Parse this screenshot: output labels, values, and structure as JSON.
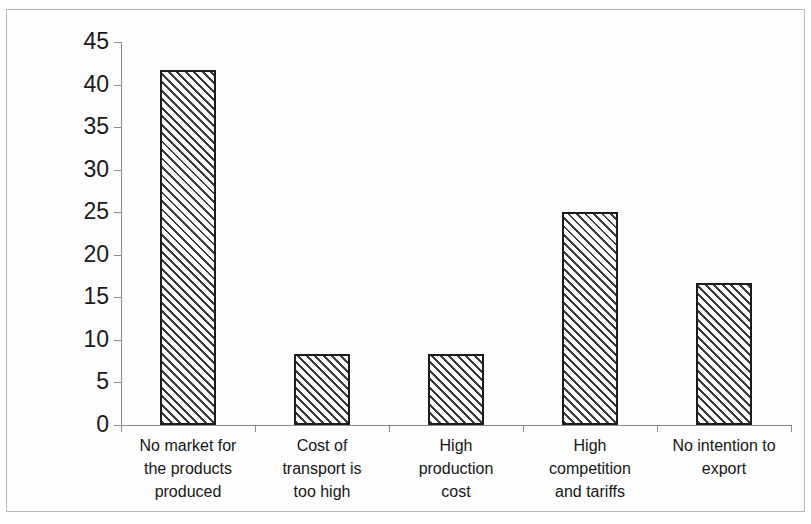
{
  "chart_data": {
    "type": "bar",
    "title": "",
    "subtitle": "",
    "xlabel": "",
    "ylabel": "",
    "ylim": [
      0,
      45
    ],
    "ytick_step": 5,
    "yticks": [
      0,
      5,
      10,
      15,
      20,
      25,
      30,
      35,
      40,
      45
    ],
    "ytick_labels": [
      "0",
      "5",
      "10",
      "15",
      "20",
      "25",
      "30",
      "35",
      "40",
      "45"
    ],
    "grid": false,
    "legend": false,
    "legend_position": "none",
    "categories": [
      "No market for the products produced",
      "Cost of transport is too high",
      "High production cost",
      "High competition and tariffs",
      "No intention to export"
    ],
    "category_lines": [
      [
        "No market for",
        "the products",
        "produced"
      ],
      [
        "Cost of",
        "transport is",
        "too high"
      ],
      [
        "High",
        "production",
        "cost"
      ],
      [
        "High",
        "competition",
        "and tariffs"
      ],
      [
        "No intention to",
        "export"
      ]
    ],
    "values": [
      41.7,
      8.3,
      8.3,
      25.0,
      16.7
    ],
    "series": [
      {
        "name": "",
        "values": [
          41.7,
          8.3,
          8.3,
          25.0,
          16.7
        ]
      }
    ],
    "bar_fill": "diagonal-hatch",
    "bar_edge_color": "#1c1c1c",
    "axis_color": "#8a8a8a",
    "frame_color": "#b9b9b9",
    "background_color": "#ffffff"
  }
}
